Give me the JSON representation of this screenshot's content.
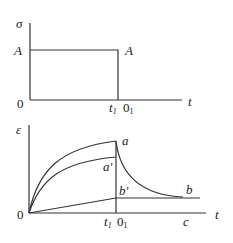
{
  "top_chart": {
    "y_label": "σ",
    "x_label": "t",
    "origin": "0",
    "level_label_left": "A",
    "level_label_right": "A",
    "t1_main": "t",
    "t1_sub": "1",
    "o1_main": "0",
    "o1_sub": "1"
  },
  "bottom_chart": {
    "y_label": "ε",
    "x_label": "t",
    "origin": "0",
    "point_a": "a",
    "point_a_prime": "a′",
    "point_b_prime": "b′",
    "point_b": "b",
    "point_c": "c",
    "t1_main": "t",
    "t1_sub": "1",
    "o1_main": "0",
    "o1_sub": "1"
  }
}
